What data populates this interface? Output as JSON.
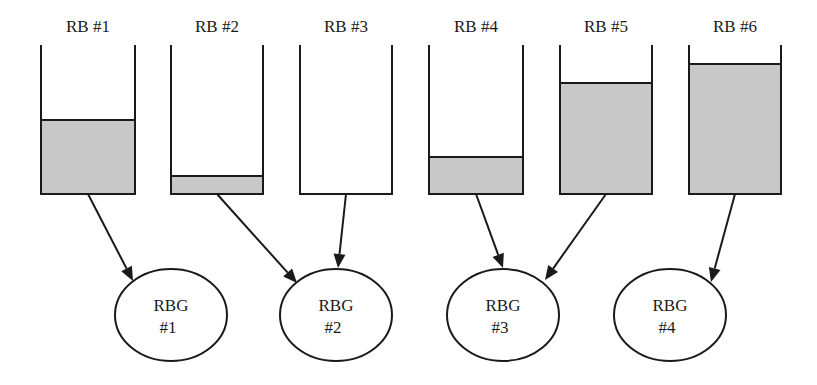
{
  "colors": {
    "stroke": "#1a1a1a",
    "fill": "#c8c8c8",
    "background": "#ffffff"
  },
  "bucket_geometry": {
    "top": 45,
    "bottom": 194
  },
  "buckets": [
    {
      "label": "RB #1",
      "x": 41,
      "w": 94,
      "fill_top": 120,
      "target": 0
    },
    {
      "label": "RB #2",
      "x": 171,
      "w": 92,
      "fill_top": 176,
      "target": 1
    },
    {
      "label": "RB #3",
      "x": 300,
      "w": 92,
      "fill_top": null,
      "target": 1
    },
    {
      "label": "RB #4",
      "x": 429,
      "w": 94,
      "fill_top": 157,
      "target": 2
    },
    {
      "label": "RB #5",
      "x": 560,
      "w": 92,
      "fill_top": 83,
      "target": 2
    },
    {
      "label": "RB #6",
      "x": 689,
      "w": 92,
      "fill_top": 64,
      "target": 3
    }
  ],
  "groups": [
    {
      "line1": "RBG",
      "line2": "#1",
      "cx": 171,
      "cy": 315,
      "rx": 56,
      "ry": 46
    },
    {
      "line1": "RBG",
      "line2": "#2",
      "cx": 336,
      "cy": 315,
      "rx": 56,
      "ry": 46
    },
    {
      "line1": "RBG",
      "line2": "#3",
      "cx": 503,
      "cy": 315,
      "rx": 56,
      "ry": 46
    },
    {
      "line1": "RBG",
      "line2": "#4",
      "cx": 670,
      "cy": 315,
      "rx": 56,
      "ry": 46
    }
  ],
  "arrows": [
    {
      "from": "RB #1",
      "to": "RBG #1",
      "x1": 88,
      "y1": 194,
      "x2": 133,
      "y2": 281
    },
    {
      "from": "RB #2",
      "to": "RBG #2",
      "x1": 217,
      "y1": 194,
      "x2": 297,
      "y2": 283
    },
    {
      "from": "RB #3",
      "to": "RBG #2",
      "x1": 346,
      "y1": 194,
      "x2": 338,
      "y2": 268
    },
    {
      "from": "RB #4",
      "to": "RBG #3",
      "x1": 476,
      "y1": 194,
      "x2": 503,
      "y2": 268
    },
    {
      "from": "RB #5",
      "to": "RBG #3",
      "x1": 606,
      "y1": 194,
      "x2": 545,
      "y2": 280
    },
    {
      "from": "RB #6",
      "to": "RBG #4",
      "x1": 735,
      "y1": 194,
      "x2": 711,
      "y2": 282
    }
  ]
}
